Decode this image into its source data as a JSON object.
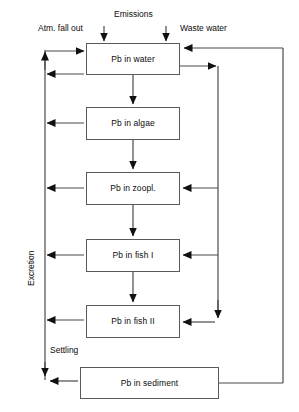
{
  "diagram": {
    "title_visible": false,
    "nodes": [
      {
        "id": "water",
        "label": "Pb in water",
        "x": 86,
        "y": 43,
        "w": 94,
        "h": 32
      },
      {
        "id": "algae",
        "label": "Pb in algae",
        "x": 86,
        "y": 107,
        "w": 94,
        "h": 33
      },
      {
        "id": "zoopl",
        "label": "Pb in zoopl.",
        "x": 86,
        "y": 172,
        "w": 94,
        "h": 33
      },
      {
        "id": "fish1",
        "label": "Pb in fish I",
        "x": 86,
        "y": 239,
        "w": 94,
        "h": 33
      },
      {
        "id": "fish2",
        "label": "Pb in fish II",
        "x": 86,
        "y": 305,
        "w": 94,
        "h": 33
      },
      {
        "id": "sediment",
        "label": "Pb in sediment",
        "x": 80,
        "y": 367,
        "w": 139,
        "h": 32
      }
    ],
    "flow_labels": [
      {
        "id": "atm-fall-out",
        "text": "Atm. fall out",
        "x": 38,
        "y": 24
      },
      {
        "id": "emissions",
        "text": "Emissions",
        "x": 114,
        "y": 10
      },
      {
        "id": "waste-water",
        "text": "Waste water",
        "x": 180,
        "y": 24
      },
      {
        "id": "settling",
        "text": "Settling",
        "x": 50,
        "y": 346
      }
    ],
    "rotated_labels": [
      {
        "id": "excretion",
        "text": "Excretion",
        "x": 27,
        "y": 286
      }
    ],
    "colors": {
      "line": "#4a4a4a",
      "box_border": "#5a5a5a",
      "arrow": "#111111",
      "text": "#0b0b0b",
      "background": "#ffffff"
    }
  }
}
